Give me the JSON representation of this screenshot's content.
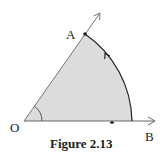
{
  "figure": {
    "caption": "Figure 2.13",
    "points": {
      "O": {
        "label": "O",
        "x": 24,
        "y": 121
      },
      "A": {
        "label": "A",
        "x": 85,
        "y": 34
      },
      "B": {
        "label": "B",
        "x": 155,
        "y": 121
      }
    },
    "rays": [
      {
        "from": "O",
        "through": "A",
        "arrow_tip": [
          100,
          13
        ]
      },
      {
        "from": "O",
        "through": "B",
        "arrow_tip": [
          155,
          121
        ]
      }
    ],
    "sector": {
      "center": "O",
      "radius": 108,
      "fill": "#dcdcdc",
      "arc_direction": "counterclockwise from OB to OA"
    },
    "angle_marker": {
      "vertex": "O",
      "radius": 18
    },
    "marks": [
      {
        "type": "dot",
        "x": 112,
        "y": 122
      }
    ],
    "colors": {
      "line": "#555555",
      "arc": "#222222",
      "fill": "#dcdcdc",
      "text": "#222222"
    }
  }
}
